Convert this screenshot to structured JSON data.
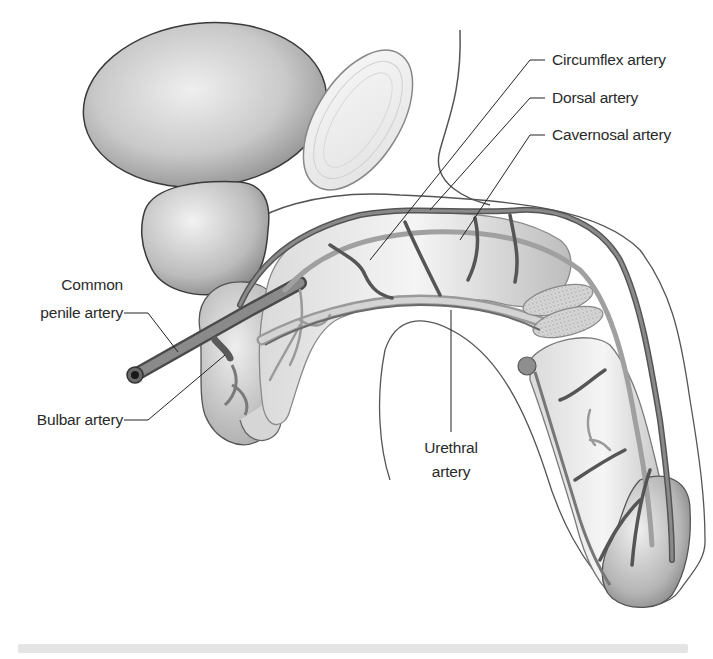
{
  "figure": {
    "type": "anatomical-illustration",
    "labels": {
      "circumflex": "Circumflex artery",
      "dorsal": "Dorsal artery",
      "cavernosal": "Cavernosal artery",
      "common_penile_line1": "Common",
      "common_penile_line2": "penile artery",
      "bulbar": "Bulbar artery",
      "urethral_line1": "Urethral",
      "urethral_line2": "artery"
    },
    "colors": {
      "background": "#ffffff",
      "outline": "#3a3a3a",
      "vessel": "#6e6e6e",
      "vessel_dark": "#4a4a4a",
      "tissue_light": "#e6e6e6",
      "tissue_mid": "#bdbdbd",
      "leader_line": "#222222",
      "label_text": "#2a2a2a"
    }
  }
}
